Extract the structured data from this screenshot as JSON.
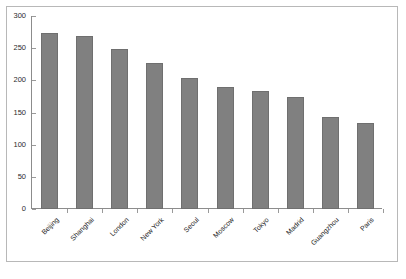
{
  "chart_data": {
    "type": "bar",
    "title": "",
    "subtitle": "",
    "xlabel": "",
    "ylabel": "",
    "categories": [
      "Beijing",
      "Shanghai",
      "London",
      "New York",
      "Seoul",
      "Moscow",
      "Tokyo",
      "Madrid",
      "Guangzhou",
      "Paris"
    ],
    "values": [
      274,
      269,
      249,
      227,
      204,
      190,
      183,
      174,
      143,
      134
    ],
    "ylim": [
      0,
      300
    ],
    "ytick_values": [
      0,
      50,
      100,
      150,
      200,
      250,
      300
    ],
    "ytick_labels": [
      "0",
      "50",
      "100",
      "150",
      "200",
      "250",
      "300"
    ],
    "grid": false,
    "legend": null,
    "legend_position": "none",
    "bar_color": "#808080",
    "bar_edge_color": "#6f6f6f",
    "axis_color": "#8c8c8c",
    "frame_color": "#b8b8b8",
    "background_color": "#ffffff",
    "text_color": "#222222",
    "xlabel_rotation_degrees": -45,
    "series": [
      {
        "name": "Number of skyscrapers",
        "values": [
          274,
          269,
          249,
          227,
          204,
          190,
          183,
          174,
          143,
          134
        ]
      }
    ]
  }
}
